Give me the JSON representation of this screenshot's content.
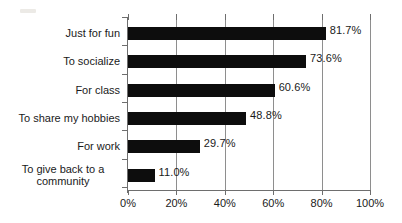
{
  "chart_data": {
    "type": "bar",
    "orientation": "horizontal",
    "title": "",
    "subtitle": "",
    "xlabel": "",
    "ylabel": "",
    "xlim": [
      0,
      100
    ],
    "xtick_labels": [
      "0%",
      "20%",
      "40%",
      "60%",
      "80%",
      "100%"
    ],
    "xticks": [
      0,
      20,
      40,
      60,
      80,
      100
    ],
    "grid": "vertical",
    "legend": "none",
    "bar_color": "#0d0d0d",
    "background_color": "#ffffff",
    "axis_color": "#6e6e6e",
    "categories": [
      "Just for fun",
      "To socialize",
      "For class",
      "To share my hobbies",
      "For work",
      "To give back to a community"
    ],
    "values": [
      81.7,
      73.6,
      60.6,
      48.8,
      29.7,
      11.0
    ],
    "value_labels": [
      "81.7%",
      "73.6%",
      "60.6%",
      "48.8%",
      "29.7%",
      "11.0%"
    ],
    "bars": [
      {
        "category": "Just for fun",
        "label_line1": "Just for fun",
        "label_line2": "",
        "value": 81.7,
        "value_label": "81.7%"
      },
      {
        "category": "To socialize",
        "label_line1": "To socialize",
        "label_line2": "",
        "value": 73.6,
        "value_label": "73.6%"
      },
      {
        "category": "For class",
        "label_line1": "For class",
        "label_line2": "",
        "value": 60.6,
        "value_label": "60.6%"
      },
      {
        "category": "To share my hobbies",
        "label_line1": "To share my hobbies",
        "label_line2": "",
        "value": 48.8,
        "value_label": "48.8%"
      },
      {
        "category": "For work",
        "label_line1": "For work",
        "label_line2": "",
        "value": 29.7,
        "value_label": "29.7%"
      },
      {
        "category": "To give back to a community",
        "label_line1": "To give back to a",
        "label_line2": "community",
        "value": 11.0,
        "value_label": "11.0%"
      }
    ]
  }
}
